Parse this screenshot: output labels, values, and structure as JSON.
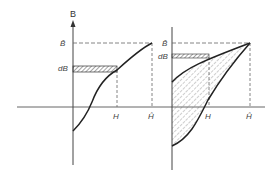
{
  "figure": {
    "left_panel": {
      "axis_y_label": "B",
      "b_max_label": "B̂",
      "db_label": "dB",
      "h_label": "H",
      "h_max_label": "Ĥ"
    },
    "right_panel": {
      "b_max_label": "B̂",
      "db_label": "dB",
      "h_label": "H",
      "h_max_label": "Ĥ"
    }
  }
}
